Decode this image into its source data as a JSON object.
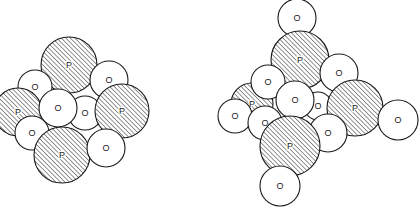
{
  "figure": {
    "legend": {
      "P": "phosphorus atom (hatched)",
      "O": "oxygen atom (plain)"
    },
    "atom_styles": {
      "P": {
        "fill": "hatched",
        "stroke": "#1a1a1a"
      },
      "O": {
        "fill": "#ffffff",
        "stroke": "#1a1a1a"
      }
    },
    "models": [
      {
        "name": "left-model",
        "atom_count": {
          "P": 4,
          "O": 6
        },
        "atoms": [
          {
            "label": "P"
          },
          {
            "label": "O"
          },
          {
            "label": "O"
          },
          {
            "label": "P"
          },
          {
            "label": "O"
          },
          {
            "label": "P"
          },
          {
            "label": "O"
          },
          {
            "label": "O"
          },
          {
            "label": "P"
          },
          {
            "label": "O"
          }
        ]
      },
      {
        "name": "right-model",
        "atom_count": {
          "P": 4,
          "O": 10
        },
        "atoms": [
          {
            "label": "O"
          },
          {
            "label": "P"
          },
          {
            "label": "O"
          },
          {
            "label": "P"
          },
          {
            "label": "O"
          },
          {
            "label": "O"
          },
          {
            "label": "O"
          },
          {
            "label": "P"
          },
          {
            "label": "O"
          },
          {
            "label": "O"
          },
          {
            "label": "O"
          },
          {
            "label": "O"
          },
          {
            "label": "P"
          },
          {
            "label": "O"
          }
        ]
      }
    ]
  }
}
